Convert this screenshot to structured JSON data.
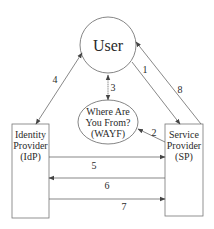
{
  "nodes": {
    "user": {
      "label": "User"
    },
    "wayf": {
      "lines": [
        "Where Are",
        "You From?",
        "(WAYF)"
      ]
    },
    "idp": {
      "lines": [
        "Identity",
        "Provider",
        "(IdP)"
      ]
    },
    "sp": {
      "lines": [
        "Service",
        "Provider",
        "(SP)"
      ]
    }
  },
  "edges": [
    {
      "id": "1",
      "from": "user",
      "to": "sp",
      "label": "1"
    },
    {
      "id": "2",
      "from": "sp",
      "to": "wayf",
      "label": "2"
    },
    {
      "id": "3",
      "from": "user",
      "to": "wayf",
      "label": "3",
      "bidirectional": true
    },
    {
      "id": "4",
      "from": "idp",
      "to": "user",
      "label": "4",
      "bidirectional": true
    },
    {
      "id": "5",
      "from": "idp",
      "to": "sp",
      "label": "5"
    },
    {
      "id": "6",
      "from": "sp",
      "to": "idp",
      "label": "6"
    },
    {
      "id": "7",
      "from": "idp",
      "to": "sp",
      "label": "7"
    },
    {
      "id": "8",
      "from": "sp",
      "to": "user",
      "label": "8"
    }
  ],
  "colors": {
    "stroke": "#555555",
    "text": "#2a2a2a",
    "background": "#ffffff"
  }
}
